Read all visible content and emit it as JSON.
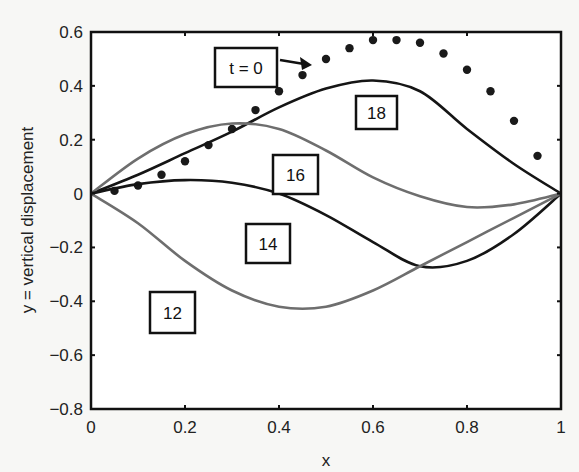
{
  "chart_data": {
    "type": "line",
    "title": "",
    "xlabel": "x",
    "ylabel": "y = vertical displacement",
    "xlim": [
      0,
      1
    ],
    "ylim": [
      -0.8,
      0.6
    ],
    "grid": false,
    "legend": "none",
    "xticks": [
      "0",
      "0.2",
      "0.4",
      "0.6",
      "0.8",
      "1"
    ],
    "yticks": [
      "0.6",
      "0.4",
      "0.2",
      "0",
      "-0.2",
      "-0.4",
      "-0.6",
      "-0.8"
    ],
    "series": [
      {
        "name": "t = 0",
        "style": "dots",
        "color": "#1a1a1a",
        "x": [
          0.05,
          0.1,
          0.15,
          0.2,
          0.25,
          0.3,
          0.35,
          0.4,
          0.45,
          0.5,
          0.55,
          0.6,
          0.65,
          0.7,
          0.75,
          0.8,
          0.85,
          0.9,
          0.95
        ],
        "y": [
          0.01,
          0.03,
          0.07,
          0.12,
          0.18,
          0.24,
          0.31,
          0.38,
          0.44,
          0.5,
          0.54,
          0.57,
          0.57,
          0.56,
          0.52,
          0.46,
          0.38,
          0.27,
          0.14
        ]
      },
      {
        "name": "18",
        "style": "line",
        "color": "#151515",
        "x": [
          0,
          0.1,
          0.2,
          0.3,
          0.4,
          0.5,
          0.6,
          0.7,
          0.8,
          0.9,
          1.0
        ],
        "y": [
          0,
          0.07,
          0.15,
          0.23,
          0.32,
          0.39,
          0.42,
          0.38,
          0.24,
          0.11,
          0
        ]
      },
      {
        "name": "16",
        "style": "line",
        "color": "#6e6e6e",
        "x": [
          0,
          0.1,
          0.2,
          0.3,
          0.4,
          0.5,
          0.6,
          0.7,
          0.8,
          0.9,
          1.0
        ],
        "y": [
          0,
          0.13,
          0.22,
          0.26,
          0.24,
          0.16,
          0.06,
          -0.01,
          -0.05,
          -0.04,
          0
        ]
      },
      {
        "name": "14",
        "style": "line",
        "color": "#151515",
        "x": [
          0,
          0.1,
          0.2,
          0.3,
          0.4,
          0.5,
          0.6,
          0.7,
          0.8,
          0.9,
          1.0
        ],
        "y": [
          0,
          0.035,
          0.05,
          0.04,
          0.0,
          -0.08,
          -0.18,
          -0.27,
          -0.25,
          -0.15,
          0
        ]
      },
      {
        "name": "12",
        "style": "line",
        "color": "#6e6e6e",
        "x": [
          0,
          0.1,
          0.2,
          0.3,
          0.4,
          0.5,
          0.6,
          0.7,
          0.8,
          0.9,
          1.0
        ],
        "y": [
          0,
          -0.11,
          -0.25,
          -0.36,
          -0.42,
          -0.42,
          -0.36,
          -0.27,
          -0.18,
          -0.09,
          0
        ]
      }
    ],
    "annotations": [
      {
        "text": "t = 0",
        "box": [
          215,
          48,
          62,
          39
        ],
        "arrow": true
      },
      {
        "text": "18",
        "box": [
          356,
          96,
          41,
          33
        ]
      },
      {
        "text": "16",
        "box": [
          273,
          155,
          45,
          39
        ]
      },
      {
        "text": "14",
        "box": [
          246,
          224,
          44,
          39
        ]
      },
      {
        "text": "12",
        "box": [
          150,
          292,
          45,
          41
        ]
      }
    ]
  }
}
